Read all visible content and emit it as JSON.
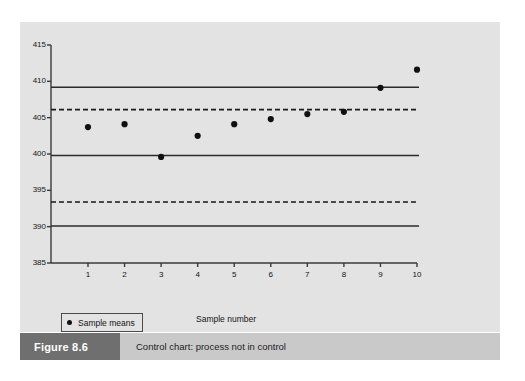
{
  "figure": {
    "number_label": "Figure 8.6",
    "caption": "Control chart: process not in control"
  },
  "legend": {
    "marker_label": "Sample means"
  },
  "colors": {
    "panel_background": "#e3e3e3",
    "axis": "#3a3a3a",
    "point": "#111111",
    "control_line": "#2b2b2b",
    "warning_line": "#1a1a1a",
    "caption_bar": "#c9c9c9",
    "caption_number_bar": "#6f6f6f",
    "caption_number_text": "#ffffff"
  },
  "chart_data": {
    "type": "scatter",
    "title": "",
    "xlabel": "Sample number",
    "ylabel": "",
    "xlim": [
      0.5,
      10.5
    ],
    "ylim": [
      385,
      415
    ],
    "grid": false,
    "legend_position": "bottom-left",
    "x_tick_labels": [
      "1",
      "2",
      "3",
      "4",
      "5",
      "6",
      "7",
      "8",
      "9",
      "10"
    ],
    "y_tick_labels": [
      "385",
      "390",
      "395",
      "400",
      "405",
      "410",
      "415"
    ],
    "x": [
      1,
      2,
      3,
      4,
      5,
      6,
      7,
      8,
      9,
      10
    ],
    "series": [
      {
        "name": "Sample means",
        "values": [
          403.7,
          404.1,
          399.6,
          402.5,
          404.1,
          404.8,
          405.5,
          405.8,
          409.1,
          411.6
        ]
      }
    ],
    "reference_lines": [
      {
        "name": "upper-control-limit",
        "value": 409.2,
        "style": "solid"
      },
      {
        "name": "upper-warning-limit",
        "value": 406.1,
        "style": "dashed"
      },
      {
        "name": "centre-line",
        "value": 399.8,
        "style": "solid"
      },
      {
        "name": "lower-warning-limit",
        "value": 393.4,
        "style": "dashed"
      },
      {
        "name": "lower-control-limit",
        "value": 390.1,
        "style": "solid"
      }
    ]
  }
}
